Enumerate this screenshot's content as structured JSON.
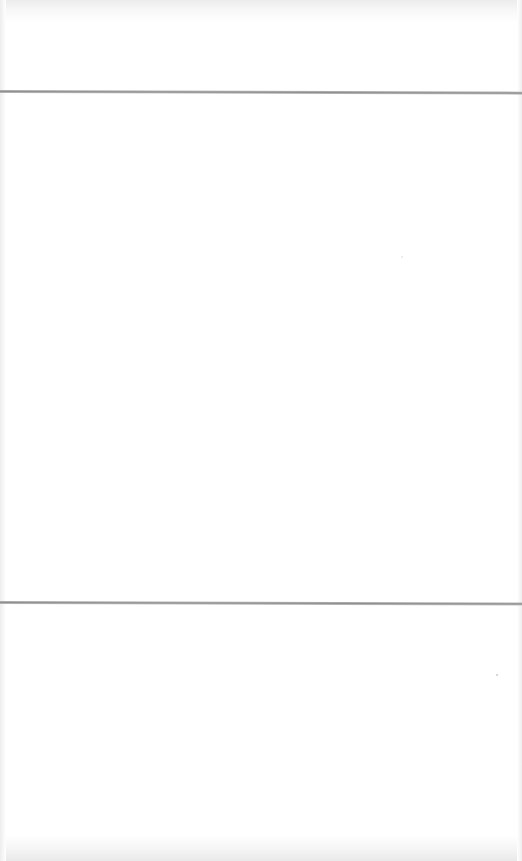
{
  "document": {
    "type": "blank scanned page",
    "rules": [
      {
        "name": "top-rule",
        "y": 91
      },
      {
        "name": "bottom-rule",
        "y": 602
      }
    ],
    "sections": {
      "header": "",
      "body": "",
      "footer": ""
    },
    "colors": {
      "background": "#ffffff",
      "rule": "#999999"
    }
  }
}
